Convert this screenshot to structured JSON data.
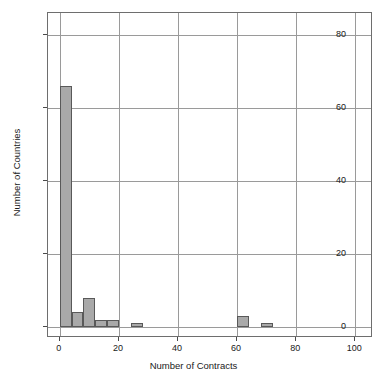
{
  "chart_data": {
    "type": "bar",
    "title": "",
    "subtitle": "",
    "xlabel": "Number of Contracts",
    "ylabel": "Number of Countries",
    "xlim": [
      -4,
      106
    ],
    "ylim": [
      -3,
      86
    ],
    "xticks": [
      0,
      20,
      40,
      60,
      80,
      100
    ],
    "yticks": [
      0,
      20,
      40,
      60,
      80
    ],
    "xtick_labels": [
      "0",
      "20",
      "40",
      "60",
      "80",
      "100"
    ],
    "ytick_labels": [
      "0",
      "20",
      "40",
      "60",
      "80"
    ],
    "grid": true,
    "legend": null,
    "bin_width": 4,
    "bar_color": "#a9a9a9",
    "bar_edge_color": "#595959",
    "grid_color": "#9a9a9a",
    "frame_color": "#6e6e6e",
    "bins": [
      {
        "x0": 0,
        "x1": 4,
        "value": 66
      },
      {
        "x0": 4,
        "x1": 8,
        "value": 4
      },
      {
        "x0": 8,
        "x1": 12,
        "value": 8
      },
      {
        "x0": 12,
        "x1": 16,
        "value": 2
      },
      {
        "x0": 16,
        "x1": 20,
        "value": 2
      },
      {
        "x0": 20,
        "x1": 24,
        "value": 0
      },
      {
        "x0": 24,
        "x1": 28,
        "value": 1
      },
      {
        "x0": 28,
        "x1": 32,
        "value": 0
      },
      {
        "x0": 32,
        "x1": 36,
        "value": 0
      },
      {
        "x0": 36,
        "x1": 40,
        "value": 0
      },
      {
        "x0": 40,
        "x1": 44,
        "value": 0
      },
      {
        "x0": 44,
        "x1": 48,
        "value": 0
      },
      {
        "x0": 48,
        "x1": 52,
        "value": 0
      },
      {
        "x0": 52,
        "x1": 56,
        "value": 0
      },
      {
        "x0": 56,
        "x1": 60,
        "value": 0
      },
      {
        "x0": 60,
        "x1": 64,
        "value": 3
      },
      {
        "x0": 64,
        "x1": 68,
        "value": 0
      },
      {
        "x0": 68,
        "x1": 72,
        "value": 1
      }
    ],
    "categories": [
      "0-4",
      "4-8",
      "8-12",
      "12-16",
      "16-20",
      "20-24",
      "24-28",
      "52-56",
      "56-60"
    ],
    "values": [
      66,
      4,
      8,
      2,
      2,
      0,
      1,
      3,
      1
    ]
  }
}
